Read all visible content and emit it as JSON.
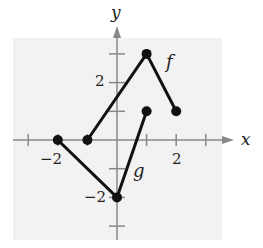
{
  "chart_data": {
    "type": "line",
    "title": "",
    "xlabel": "x",
    "ylabel": "y",
    "xlim": [
      -3,
      3
    ],
    "ylim": [
      -3,
      3
    ],
    "x_ticks": [
      -3,
      -2,
      -1,
      1,
      2,
      3
    ],
    "y_ticks": [
      -3,
      -2,
      -1,
      1,
      2,
      3
    ],
    "x_tick_labels": [
      {
        "value": -2,
        "text": "−2"
      },
      {
        "value": 2,
        "text": "2"
      }
    ],
    "y_tick_labels": [
      {
        "value": 2,
        "text": "2"
      },
      {
        "value": -2,
        "text": "−2"
      }
    ],
    "grid": false,
    "series": [
      {
        "name": "f",
        "points": [
          [
            -1,
            0
          ],
          [
            1,
            3
          ],
          [
            2,
            1
          ]
        ],
        "label_pos": [
          1.9,
          2.7
        ]
      },
      {
        "name": "g",
        "points": [
          [
            -2,
            0
          ],
          [
            0,
            -2
          ],
          [
            1,
            1
          ]
        ],
        "label_pos": [
          0.65,
          -1.15
        ]
      }
    ]
  },
  "labels": {
    "x_axis": "x",
    "y_axis": "y",
    "f": "f",
    "g": "g",
    "x_neg2": "−2",
    "x_pos2": "2",
    "y_pos2": "2",
    "y_neg2": "−2"
  },
  "colors": {
    "panel_bg": "#f2f2f2",
    "axis": "#888888",
    "curve": "#111111"
  }
}
